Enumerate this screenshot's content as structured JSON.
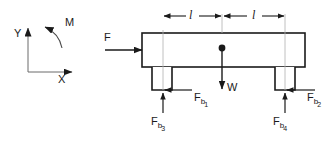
{
  "diagram": {
    "stroke_color": "#1a1a1a",
    "fill_color": "#ffffff",
    "axes": {
      "y_label": "Y",
      "x_label": "X",
      "moment_label": "M"
    },
    "body": {
      "applied_force_label": "F",
      "weight_label": "W"
    },
    "dimensions": [
      {
        "label": "l"
      },
      {
        "label": "l"
      }
    ],
    "reactions": [
      {
        "base": "F",
        "sub": "b",
        "index": "1"
      },
      {
        "base": "F",
        "sub": "b",
        "index": "2"
      },
      {
        "base": "F",
        "sub": "b",
        "index": "3"
      },
      {
        "base": "F",
        "sub": "b",
        "index": "4"
      }
    ]
  }
}
